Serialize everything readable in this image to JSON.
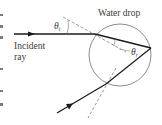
{
  "diagram": {
    "labels": {
      "water_drop": "Water drop",
      "incident_line1": "Incident",
      "incident_line2": "ray",
      "theta_i_symbol": "θ",
      "theta_i_sub": "i",
      "theta_r_symbol": "θ",
      "theta_r_sub": "r"
    },
    "colors": {
      "ray": "#1a1a1a",
      "circle": "#6e6e6e",
      "normal": "#6e6e6e",
      "text": "#3a3a3a"
    },
    "elements": [
      {
        "name": "incident-ray",
        "type": "arrow",
        "from": [
          14,
          34
        ],
        "to": [
          95,
          34
        ]
      },
      {
        "name": "refracted-ray",
        "type": "line",
        "from": [
          95,
          34
        ],
        "to": [
          151,
          48
        ]
      },
      {
        "name": "internally-reflected-ray",
        "type": "line",
        "from": [
          151,
          48
        ],
        "to": [
          106,
          84
        ]
      },
      {
        "name": "emergent-ray",
        "type": "arrow",
        "from": [
          106,
          84
        ],
        "to": [
          57,
          113
        ]
      },
      {
        "name": "water-drop",
        "type": "circle",
        "center": [
          120,
          55
        ],
        "radius": 31
      },
      {
        "name": "normal-entry",
        "type": "dashed-line",
        "from": [
          63,
          17
        ],
        "to": [
          126,
          52
        ]
      },
      {
        "name": "normal-exit",
        "type": "dashed-line",
        "from": [
          116,
          68
        ],
        "to": [
          88,
          118
        ]
      }
    ]
  }
}
